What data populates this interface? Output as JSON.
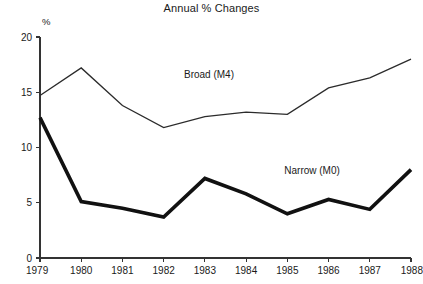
{
  "chart_data": {
    "type": "line",
    "title": "Annual % Changes",
    "xlabel": "",
    "ylabel": "%",
    "unit_label": "%",
    "x": [
      "1979",
      "1980",
      "1981",
      "1982",
      "1983",
      "1984",
      "1985",
      "1986",
      "1987",
      "1988"
    ],
    "categories": [
      "1979",
      "1980",
      "1981",
      "1982",
      "1983",
      "1984",
      "1985",
      "1986",
      "1987",
      "1988"
    ],
    "ylim": [
      0,
      20
    ],
    "yticks": [
      "0",
      "5",
      "10",
      "15",
      "20"
    ],
    "ytick_values": [
      0,
      5,
      10,
      15,
      20
    ],
    "grid": false,
    "legend": "inline-annotations",
    "series": [
      {
        "name": "Broad (M4)",
        "style": "thin",
        "color": "#2b2b2b",
        "values": [
          14.7,
          17.2,
          13.8,
          11.8,
          12.8,
          13.2,
          13.0,
          15.4,
          16.3,
          18.0
        ]
      },
      {
        "name": "Narrow (M0)",
        "style": "thick",
        "color": "#111111",
        "values": [
          12.7,
          5.1,
          4.5,
          3.7,
          7.2,
          5.8,
          4.0,
          5.3,
          4.4,
          8.0
        ]
      }
    ],
    "annotations": [
      {
        "text": "Broad (M4)",
        "x": 1983.1,
        "y": 16.3
      },
      {
        "text": "Narrow (M0)",
        "x": 1985.6,
        "y": 7.6
      }
    ]
  }
}
